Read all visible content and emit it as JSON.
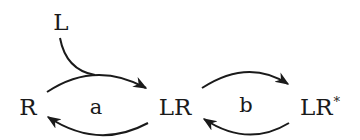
{
  "diagram": {
    "type": "reaction-scheme",
    "nodes": [
      {
        "id": "L",
        "label": "L",
        "x": 61,
        "y": 22
      },
      {
        "id": "R",
        "label": "R",
        "x": 28,
        "y": 107
      },
      {
        "id": "LR",
        "label": "LR",
        "x": 175,
        "y": 107
      },
      {
        "id": "LRstar",
        "label": "LR",
        "superscript": "*",
        "x": 318,
        "y": 107
      }
    ],
    "rate_labels": [
      {
        "id": "a",
        "label": "a",
        "x": 96,
        "y": 107
      },
      {
        "id": "b",
        "label": "b",
        "x": 246,
        "y": 107
      }
    ],
    "edges": [
      {
        "from": "R",
        "to": "LR",
        "direction": "forward",
        "position": "top"
      },
      {
        "from": "LR",
        "to": "R",
        "direction": "reverse",
        "position": "bottom"
      },
      {
        "from": "L",
        "to": "R->LR",
        "direction": "joins-forward-arc"
      },
      {
        "from": "LR",
        "to": "LRstar",
        "direction": "forward",
        "position": "top"
      },
      {
        "from": "LRstar",
        "to": "LR",
        "direction": "reverse",
        "position": "bottom"
      }
    ],
    "stroke_color": "#1a1a1a"
  }
}
